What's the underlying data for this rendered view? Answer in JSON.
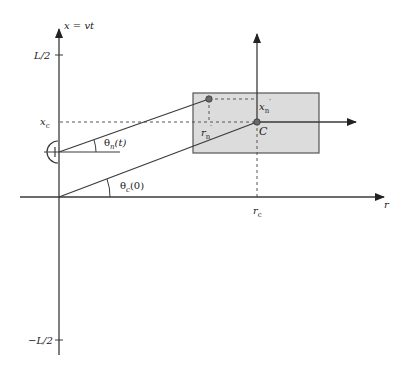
{
  "diagram": {
    "width": 406,
    "height": 369,
    "colors": {
      "line": "#3a3a3a",
      "dash": "#555555",
      "region_fill": "#dcdcdc",
      "region_stroke": "#555555",
      "point_fill": "#6a6a6a",
      "text": "#222222"
    },
    "axes": {
      "vertical": {
        "label": "x = vt",
        "x": 59,
        "y_top": 28,
        "y_bottom": 355
      },
      "horizontal": {
        "label": "r",
        "y": 197,
        "x_left": 20,
        "x_right": 384
      }
    },
    "ticks": {
      "top": {
        "label": "L/2",
        "y": 55
      },
      "bottom": {
        "label": "−L/2",
        "y": 340
      },
      "xc": {
        "label": "x",
        "sub": "c",
        "y": 122
      },
      "rc": {
        "label": "r",
        "sub": "c",
        "x": 257
      }
    },
    "detector": {
      "label": "detector-symbol",
      "x": 59,
      "y": 152,
      "line_right": 120
    },
    "region": {
      "x": 193,
      "y": 93,
      "w": 126,
      "h": 60
    },
    "local_axes": {
      "origin": {
        "x": 257,
        "y": 122
      },
      "vertical_top": 33,
      "horizontal_right": 356
    },
    "points": {
      "center": {
        "label": "C",
        "x": 257,
        "y": 122
      },
      "n": {
        "x": 209,
        "y": 99
      }
    },
    "labels": {
      "xn_prime": {
        "main": "x",
        "sub": "n",
        "prime": "′"
      },
      "rn_prime": {
        "main": "r",
        "sub": "n",
        "prime": "′"
      },
      "theta_n": {
        "main": "θ",
        "sub": "n",
        "arg": "(t)"
      },
      "theta_c": {
        "main": "θ",
        "sub": "c",
        "arg": "(0)"
      }
    }
  }
}
